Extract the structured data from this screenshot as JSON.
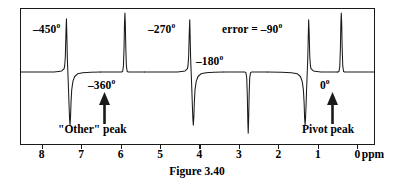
{
  "figure": {
    "caption": "Figure 3.40"
  },
  "axis": {
    "unit": "ppm",
    "ticks": [
      {
        "ppm": 8,
        "label": "8"
      },
      {
        "ppm": 7,
        "label": "7"
      },
      {
        "ppm": 6,
        "label": "6"
      },
      {
        "ppm": 5,
        "label": "5"
      },
      {
        "ppm": 4,
        "label": "4"
      },
      {
        "ppm": 3,
        "label": "3"
      },
      {
        "ppm": 2,
        "label": "2"
      },
      {
        "ppm": 1,
        "label": "1"
      },
      {
        "ppm": 0,
        "label": "0"
      }
    ]
  },
  "phase_labels": {
    "minus450": "–450",
    "minus360": "–360",
    "minus270": "–270",
    "minus180": "–180",
    "error_minus90": "error = –90",
    "zero": "0",
    "degree": "o"
  },
  "annotations": {
    "other_peak": "\"Other\" peak",
    "pivot_peak": "Pivot peak"
  },
  "colors": {
    "trace": "#1a1a1a",
    "frame": "#1a1a1a",
    "background": "#ffffff"
  },
  "chart_data": {
    "type": "line",
    "title": "Figure 3.40",
    "xlabel": "ppm",
    "ylabel": "",
    "xlim": [
      8.55,
      -0.45
    ],
    "ylim": [
      -1.0,
      1.0
    ],
    "grid": false,
    "legend": null,
    "x_axis_direction": "reversed",
    "baseline_y": 0,
    "tick_labels": [
      "8",
      "7",
      "6",
      "5",
      "4",
      "3",
      "2",
      "1",
      "0"
    ],
    "peaks": [
      {
        "ppm": 7.8,
        "phase_deg": -450,
        "lineshape": "dispersive",
        "label": "–450°",
        "up_amplitude": 0.82,
        "down_amplitude": -0.7
      },
      {
        "ppm": 6.3,
        "phase_deg": -360,
        "lineshape": "absorptive",
        "label": "–360°",
        "up_amplitude": 1.0,
        "down_amplitude": 0.0
      },
      {
        "ppm": 4.8,
        "phase_deg": -270,
        "lineshape": "dispersive",
        "label": "–270°",
        "up_amplitude": 0.82,
        "down_amplitude": -0.7
      },
      {
        "ppm": 3.3,
        "phase_deg": -180,
        "lineshape": "inverted",
        "label": "–180°",
        "up_amplitude": 0.0,
        "down_amplitude": -1.0
      },
      {
        "ppm": 1.8,
        "phase_deg": -90,
        "lineshape": "dispersive-mirrored",
        "label": "error = –90°",
        "up_amplitude": 0.82,
        "down_amplitude": -0.7
      },
      {
        "ppm": 0.35,
        "phase_deg": 0,
        "lineshape": "absorptive",
        "label": "0°",
        "up_amplitude": 1.0,
        "down_amplitude": 0.0
      }
    ],
    "annotated_peaks": [
      {
        "ppm": 6.3,
        "annotation": "\"Other\" peak"
      },
      {
        "ppm": 0.35,
        "annotation": "Pivot peak"
      }
    ]
  }
}
